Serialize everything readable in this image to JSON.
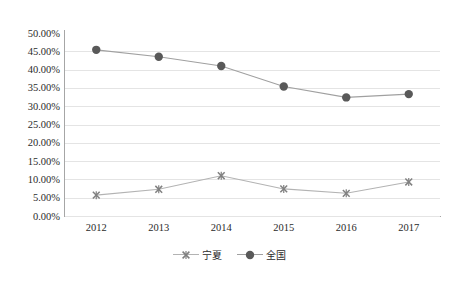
{
  "chart_data": {
    "type": "line",
    "title": "",
    "subtitle": "",
    "xlabel": "",
    "ylabel": "",
    "categories": [
      "2012",
      "2013",
      "2014",
      "2015",
      "2016",
      "2017"
    ],
    "ylim": [
      0,
      50
    ],
    "ytick_labels": [
      "50.00%",
      "45.00%",
      "40.00%",
      "35.00%",
      "30.00%",
      "25.00%",
      "20.00%",
      "15.00%",
      "10.00%",
      "5.00%",
      "0.00%"
    ],
    "ytick_values": [
      50,
      45,
      40,
      35,
      30,
      25,
      20,
      15,
      10,
      5,
      0
    ],
    "grid": true,
    "grid_axis": "y",
    "legend_position": "bottom-center",
    "series": [
      {
        "name": "宁夏",
        "marker": "x-marker",
        "color": "#b3b3b3",
        "marker_color": "#808080",
        "values": [
          5.7,
          7.3,
          11.0,
          7.4,
          6.2,
          9.3
        ]
      },
      {
        "name": "全国",
        "marker": "filled-circle-marker",
        "color": "#a0a0a0",
        "marker_color": "#595959",
        "values": [
          45.4,
          43.5,
          41.0,
          35.4,
          32.4,
          33.3
        ]
      }
    ],
    "colors": {
      "axis": "#a6a6a6",
      "gridline": "#e4e4e4",
      "text": "#2b2b2b",
      "background": "#ffffff"
    }
  }
}
